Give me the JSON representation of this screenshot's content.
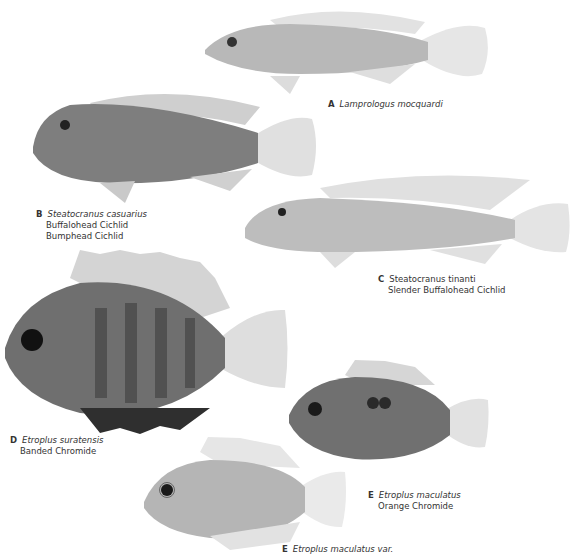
{
  "plate": {
    "background": "#ffffff",
    "entries": [
      {
        "letter": "A",
        "scientific_name": "Lamprologus mocquardi",
        "common_names": []
      },
      {
        "letter": "B",
        "scientific_name": "Steatocranus casuarius",
        "common_names": [
          "Buffalohead Cichlid",
          "Bumphead Cichlid"
        ]
      },
      {
        "letter": "C",
        "scientific_name": "Steatocranus tinanti",
        "common_names": [
          "Slender Buffalohead Cichlid"
        ]
      },
      {
        "letter": "D",
        "scientific_name": "Etroplus suratensis",
        "common_names": [
          "Banded Chromide"
        ]
      },
      {
        "letter": "E",
        "scientific_name": "Etroplus maculatus",
        "common_names": [
          "Orange Chromide"
        ]
      },
      {
        "letter": "E",
        "scientific_name": "Etroplus maculatus var.",
        "common_names": []
      }
    ]
  }
}
